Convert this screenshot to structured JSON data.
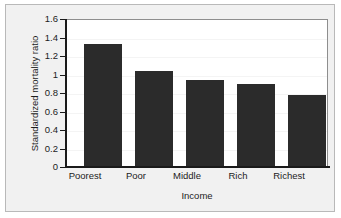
{
  "chart_data": {
    "type": "bar",
    "title": "",
    "subtitle": "",
    "xlabel": "Income",
    "ylabel": "Standardized mortality ratio",
    "categories": [
      "Poorest",
      "Poor",
      "Middle",
      "Rich",
      "Richest"
    ],
    "values": [
      1.34,
      1.04,
      0.95,
      0.9,
      0.78
    ],
    "series": [
      {
        "name": "Standardized mortality ratio",
        "values": [
          1.34,
          1.04,
          0.95,
          0.9,
          0.78
        ]
      }
    ],
    "ylim": [
      0,
      1.6
    ],
    "yticks": [
      0,
      0.2,
      0.4,
      0.6,
      0.8,
      1,
      1.2,
      1.4,
      1.6
    ],
    "ytick_labels": [
      "0",
      "0.2",
      "0.4",
      "0.6",
      "0.8",
      "1",
      "1.2",
      "1.4",
      "1.6"
    ],
    "grid": true,
    "legend": false,
    "legend_position": "none",
    "annotations": [],
    "colors": {
      "bar_fill": "#2b2b2b",
      "axis": "#1a1a1a",
      "plot_background": "#ffffff",
      "figure_background": "#f1f1f1",
      "figure_border": "#b9b9b9",
      "gridline": "#f4f4f4",
      "text": "#1c1c1c"
    }
  }
}
